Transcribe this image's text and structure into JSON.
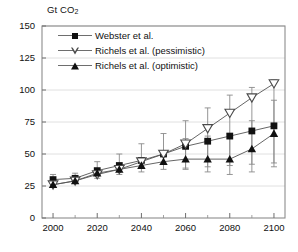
{
  "chart_data": {
    "type": "line",
    "title": "",
    "ylabel": "Gt CO2",
    "xlabel": "",
    "xlim": [
      1995,
      2105
    ],
    "ylim": [
      0,
      150
    ],
    "ytick_values": [
      0,
      25,
      50,
      75,
      100,
      125,
      150
    ],
    "ytick_labels": [
      "0",
      "25",
      "50",
      "75",
      "100",
      "125",
      "150"
    ],
    "xtick_values": [
      2000,
      2020,
      2040,
      2060,
      2080,
      2100
    ],
    "xtick_labels": [
      "2000",
      "2020",
      "2040",
      "2060",
      "2080",
      "2100"
    ],
    "xminor_values": [
      2010,
      2030,
      2050,
      2070,
      2090
    ],
    "grid": true,
    "grid_axis": "y",
    "legend_position": "upper-left-inside",
    "x": [
      2000,
      2010,
      2020,
      2030,
      2040,
      2050,
      2060,
      2070,
      2080,
      2090,
      2100
    ],
    "series": [
      {
        "name": "Webster et al.",
        "marker": "filled-square",
        "color": "#111111",
        "values": [
          30,
          31,
          37,
          41,
          45,
          50,
          56,
          60,
          64,
          68,
          72
        ],
        "err_low": [
          26,
          28,
          31,
          34,
          36,
          38,
          39,
          40,
          41,
          42,
          43
        ],
        "err_high": [
          34,
          35,
          44,
          50,
          58,
          66,
          76,
          86,
          96,
          102,
          108
        ]
      },
      {
        "name": "Richels et al. (pessimistic)",
        "marker": "open-down-triangle",
        "color": "#4a4a4a",
        "values": [
          26,
          29,
          34,
          38,
          44,
          50,
          58,
          70,
          82,
          94,
          105
        ],
        "err_low": [
          26,
          29,
          34,
          38,
          44,
          50,
          58,
          70,
          82,
          94,
          105
        ],
        "err_high": [
          26,
          29,
          34,
          38,
          44,
          50,
          58,
          70,
          82,
          94,
          105
        ]
      },
      {
        "name": "Richels et al. (optimistic)",
        "marker": "filled-up-triangle",
        "color": "#111111",
        "values": [
          26,
          29,
          35,
          38,
          41,
          44,
          46,
          46,
          46,
          54,
          66
        ],
        "err_low": [
          26,
          29,
          35,
          38,
          41,
          44,
          38,
          36,
          34,
          36,
          40
        ],
        "err_high": [
          26,
          29,
          35,
          38,
          41,
          44,
          62,
          64,
          66,
          76,
          92
        ]
      }
    ]
  },
  "caption": {
    "text": ""
  }
}
